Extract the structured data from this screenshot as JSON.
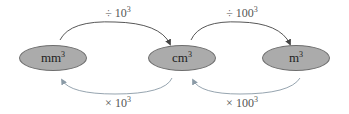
{
  "diagram": {
    "nodes": [
      {
        "unit": "mm",
        "power": "3"
      },
      {
        "unit": "cm",
        "power": "3"
      },
      {
        "unit": "m",
        "power": "3"
      }
    ],
    "forward_labels": [
      {
        "op": "÷ 10",
        "power": "3"
      },
      {
        "op": "÷ 100",
        "power": "3"
      }
    ],
    "backward_labels": [
      {
        "op": "× 10",
        "power": "3"
      },
      {
        "op": "× 100",
        "power": "3"
      }
    ],
    "colors": {
      "node_fill": "#ababab",
      "node_stroke": "#6e6e6e",
      "arrow_forward": "#444444",
      "arrow_backward": "#8a9aa6"
    }
  }
}
